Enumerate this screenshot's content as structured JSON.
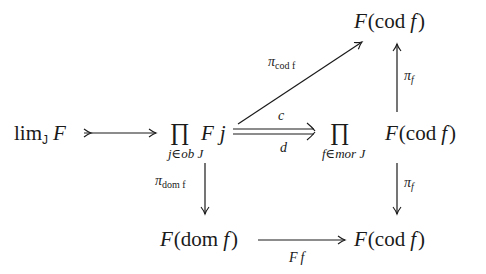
{
  "diagram": {
    "type": "commutative-diagram",
    "nodes": {
      "limit": {
        "main": "lim",
        "sub": "J",
        "obj": "F"
      },
      "prod_ob": {
        "symbol": "∏",
        "sub": "j∈ob J",
        "body_F": "F",
        "body_j": "j"
      },
      "prod_mor": {
        "symbol": "∏",
        "sub": "f∈mor J",
        "body": "F(cod f)",
        "body_F": "F",
        "body_paren_open": "(",
        "body_cod": "cod",
        "body_f": "f",
        "body_paren_close": ")"
      },
      "top_cod": {
        "F": "F",
        "open": "(",
        "cod": "cod",
        "f": "f",
        "close": ")"
      },
      "bottom_dom": {
        "F": "F",
        "open": "(",
        "dom": "dom",
        "f": "f",
        "close": ")"
      },
      "bottom_cod": {
        "F": "F",
        "open": "(",
        "cod": "cod",
        "f": "f",
        "close": ")"
      }
    },
    "arrows": {
      "lim_to_prod": {
        "kind": "monomorphism",
        "label": ""
      },
      "c": {
        "label": "c"
      },
      "d": {
        "label": "d"
      },
      "pi_cod_f": {
        "pi": "π",
        "sub": "cod f"
      },
      "pi_f_up": {
        "pi": "π",
        "sub": "f"
      },
      "pi_dom_f": {
        "pi": "π",
        "sub": "dom f"
      },
      "pi_f_down": {
        "pi": "π",
        "sub": "f"
      },
      "Ff": {
        "F": "F",
        "f": "f"
      }
    }
  }
}
